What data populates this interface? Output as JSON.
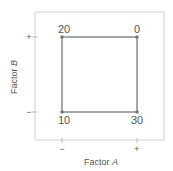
{
  "diagram": {
    "type": "factorial-design-square",
    "x_axis": {
      "label": "Factor",
      "label_var": "A",
      "ticks": [
        "−",
        "+"
      ]
    },
    "y_axis": {
      "label": "Factor",
      "label_var": "B",
      "ticks": [
        "−",
        "+"
      ]
    },
    "points": [
      {
        "A": "−",
        "B": "+",
        "value": "20"
      },
      {
        "A": "+",
        "B": "+",
        "value": "0"
      },
      {
        "A": "−",
        "B": "−",
        "value": "10"
      },
      {
        "A": "+",
        "B": "−",
        "value": "30"
      }
    ],
    "colors": {
      "frame": "#d0d0d0",
      "square": "#8a8a8a",
      "point": "#777777",
      "text": "#555555"
    }
  }
}
